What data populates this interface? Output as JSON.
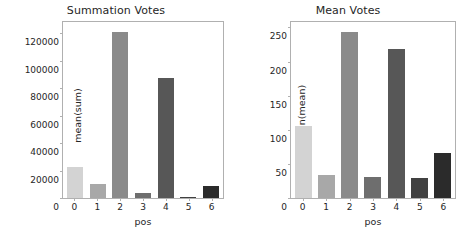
{
  "figure": {
    "width": 464,
    "height": 242,
    "background": "#ffffff"
  },
  "bar_colors": [
    "#d3d3d3",
    "#a8a8a8",
    "#8a8a8a",
    "#6e6e6e",
    "#575757",
    "#414141",
    "#2b2b2b"
  ],
  "chart_data": [
    {
      "type": "bar",
      "title": "Summation Votes",
      "xlabel": "pos",
      "ylabel": "mean(sum)",
      "categories": [
        "0",
        "1",
        "2",
        "3",
        "4",
        "5",
        "6"
      ],
      "values": [
        22500,
        10500,
        121000,
        4000,
        87500,
        400,
        8500
      ],
      "ylim": [
        0,
        128000
      ],
      "yticks": [
        0,
        20000,
        40000,
        60000,
        80000,
        100000,
        120000
      ],
      "ytick_labels": [
        "0",
        "20000",
        "40000",
        "60000",
        "80000",
        "100000",
        "120000"
      ],
      "grid": false,
      "legend": "none"
    },
    {
      "type": "bar",
      "title": "Mean Votes",
      "xlabel": "pos",
      "ylabel": "mean(mean)",
      "categories": [
        "0",
        "1",
        "2",
        "3",
        "4",
        "5",
        "6"
      ],
      "values": [
        105,
        34,
        243,
        31,
        218,
        30,
        66
      ],
      "ylim": [
        0,
        258
      ],
      "yticks": [
        0,
        50,
        100,
        150,
        200,
        250
      ],
      "ytick_labels": [
        "0",
        "50",
        "100",
        "150",
        "200",
        "250"
      ],
      "grid": false,
      "legend": "none"
    }
  ]
}
